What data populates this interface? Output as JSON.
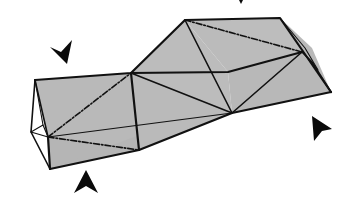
{
  "figure": {
    "colors": {
      "background": "#ffffff",
      "face_fill": "#b9b9b9",
      "edge": "#111111",
      "arrow": "#0a0a0a"
    },
    "markers": [
      {
        "name": "arrow-top-left",
        "direction": "down-right"
      },
      {
        "name": "arrow-top",
        "direction": "down",
        "clipped": true
      },
      {
        "name": "arrow-bottom",
        "direction": "up"
      },
      {
        "name": "arrow-right",
        "direction": "up-left"
      }
    ]
  }
}
